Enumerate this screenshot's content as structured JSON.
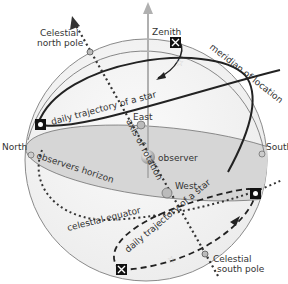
{
  "diagram": {
    "labels": {
      "zenith": "Zenith",
      "celestial_north_pole_line1": "Celestial",
      "celestial_north_pole_line2": "north pole",
      "celestial_south_pole_line1": "Celestial",
      "celestial_south_pole_line2": "south pole",
      "meridian": "meridian of location",
      "daily_trajectory_upper": "daily trajectory of a star",
      "daily_trajectory_lower": "daily trajectory of a star",
      "east": "East",
      "west": "West",
      "north": "North",
      "south": "South",
      "axis_of_rotation": "axis of rotation",
      "observer": "observer",
      "observers_horizon": "observers horizon",
      "celestial_equator": "celestial equator"
    },
    "colors": {
      "sphere_fill": "#f2f2f2",
      "sphere_stroke": "#8a8a8a",
      "horizon_fill": "#d9d9d9",
      "trajectory": "#222222",
      "axis_dots": "#333333",
      "zenith_arrow": "#b0b0b0",
      "text": "#333333"
    }
  }
}
